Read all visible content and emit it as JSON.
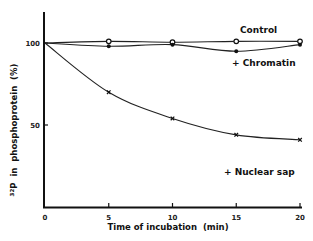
{
  "chart_data": {
    "type": "line",
    "title": "",
    "xlabel": "Time of incubation  (min)",
    "ylabel": "32P in phosphoprotein (%)",
    "ylabel_superscript": "32",
    "ylabel_main": "P  in  phosphoprotein  (%)",
    "xlim": [
      0,
      20
    ],
    "ylim": [
      0,
      120
    ],
    "x_ticks": [
      0,
      5,
      10,
      15,
      20
    ],
    "x_tick_labels": [
      "0",
      "5",
      "10",
      "15",
      "20"
    ],
    "y_ticks": [
      50,
      100
    ],
    "y_tick_labels": [
      "50",
      "100"
    ],
    "grid": false,
    "x": [
      0,
      5,
      10,
      15,
      20
    ],
    "series": [
      {
        "name": "Control",
        "marker": "open-circle",
        "values": [
          100,
          101,
          100.5,
          101,
          101
        ]
      },
      {
        "name": "+ Chromatin",
        "marker": "filled-circle",
        "values": [
          100,
          98,
          99,
          95,
          99
        ]
      },
      {
        "name": "+ Nuclear sap",
        "marker": "cross",
        "values": [
          100,
          70,
          54,
          44,
          41
        ]
      }
    ]
  }
}
